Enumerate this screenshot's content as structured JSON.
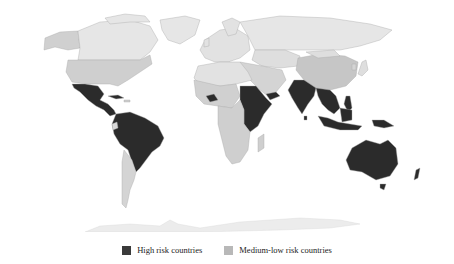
{
  "map": {
    "title": "World map of risk countries",
    "colors": {
      "high": "#2b2b2b",
      "medium_low": "#c9c9c9",
      "light": "#e4e4e4",
      "antarctica": "#ececec",
      "border": "#a8a8a8",
      "background": "#ffffff"
    },
    "high_risk_regions": [
      "Mexico",
      "Central America",
      "Cuba",
      "Northern/central South America (Colombia, Venezuela, Guianas, Peru, Brazil, Bolivia, Paraguay)",
      "Burkina Faso",
      "Sudan",
      "South Sudan",
      "Ethiopia",
      "Somalia",
      "Kenya",
      "Tanzania",
      "Yemen",
      "India",
      "Sri Lanka",
      "Bangladesh",
      "Myanmar",
      "Thailand",
      "Laos",
      "Cambodia",
      "Vietnam",
      "Philippines",
      "Malaysia",
      "Indonesia",
      "Papua New Guinea",
      "Australia"
    ]
  },
  "legend": {
    "items": [
      {
        "label": "High risk countries",
        "color": "#3a3a3a"
      },
      {
        "label": "Medium-low risk countries",
        "color": "#b8b8b8"
      }
    ]
  }
}
